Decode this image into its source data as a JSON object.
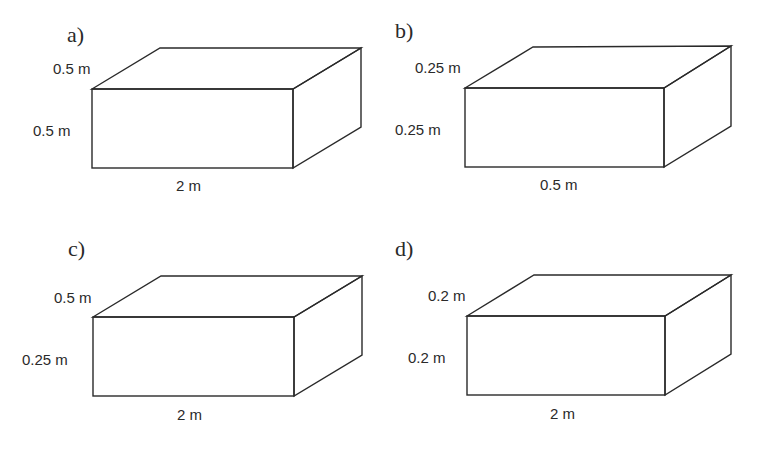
{
  "figure": {
    "boxes": [
      {
        "id": "a",
        "label": "a)",
        "depth": "0.5 m",
        "height": "0.5 m",
        "length": "2 m"
      },
      {
        "id": "b",
        "label": "b)",
        "depth": "0.25 m",
        "height": "0.25 m",
        "length": "0.5 m"
      },
      {
        "id": "c",
        "label": "c)",
        "depth": "0.5 m",
        "height": "0.25 m",
        "length": "2 m"
      },
      {
        "id": "d",
        "label": "d)",
        "depth": "0.2 m",
        "height": "0.2 m",
        "length": "2 m"
      }
    ]
  }
}
